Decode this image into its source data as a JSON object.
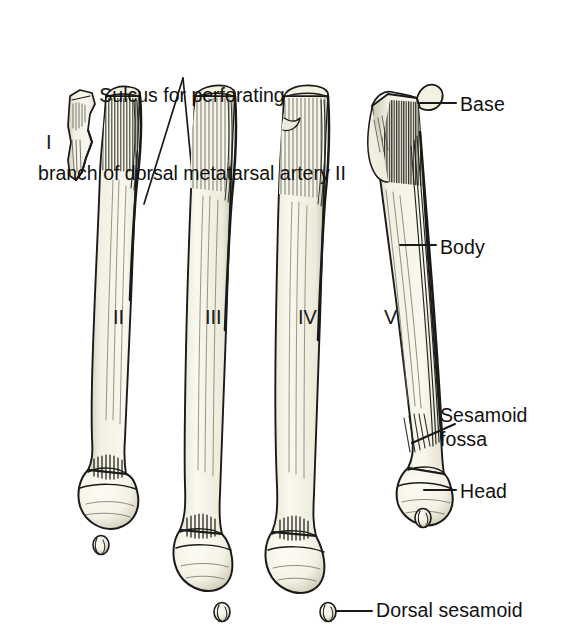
{
  "figure": {
    "kind": "anatomical-illustration",
    "background_color": "#ffffff",
    "ink_color": "#1a1a1a",
    "bone_fill_color": "#f7f5e8",
    "bone_shadow_color": "#d9d6c2"
  },
  "title": {
    "line1": "Sulcus for perforating",
    "line2": "branch of dorsal metatarsal artery II"
  },
  "numerals": [
    {
      "text": "I",
      "x": 46,
      "y": 132
    },
    {
      "text": "II",
      "x": 113,
      "y": 307
    },
    {
      "text": "III",
      "x": 205,
      "y": 307
    },
    {
      "text": "IV",
      "x": 298,
      "y": 307
    },
    {
      "text": "V",
      "x": 384,
      "y": 307
    }
  ],
  "labels": [
    {
      "id": "base",
      "text": "Base",
      "x": 460,
      "y": 93
    },
    {
      "id": "body",
      "text": "Body",
      "x": 440,
      "y": 236
    },
    {
      "id": "sesamoid-fossa-1",
      "text": "Sesamoid",
      "x": 440,
      "y": 404
    },
    {
      "id": "sesamoid-fossa-2",
      "text": "fossa",
      "x": 440,
      "y": 428
    },
    {
      "id": "head",
      "text": "Head",
      "x": 460,
      "y": 480
    },
    {
      "id": "dorsal-sesamoid",
      "text": "Dorsal sesamoid",
      "x": 356,
      "y": 599
    }
  ],
  "bones": [
    {
      "id": "metatarsal-1",
      "numeral": "I",
      "note": "proximal fragment only"
    },
    {
      "id": "metatarsal-2",
      "numeral": "II",
      "note": "full bone with head and sesamoid"
    },
    {
      "id": "metatarsal-3",
      "numeral": "III",
      "note": "full bone with head and sesamoid"
    },
    {
      "id": "metatarsal-4",
      "numeral": "IV",
      "note": "full bone with head and labelled dorsal sesamoid"
    },
    {
      "id": "metatarsal-5",
      "numeral": "V",
      "note": "full bone with tuberosity, sesamoid fossa, head and sesamoid"
    }
  ],
  "sesamoids": [
    {
      "id": "sesamoid-2",
      "x": 101,
      "y": 545
    },
    {
      "id": "sesamoid-3",
      "x": 222,
      "y": 612
    },
    {
      "id": "sesamoid-4",
      "x": 328,
      "y": 612
    },
    {
      "id": "sesamoid-5",
      "x": 423,
      "y": 518
    }
  ]
}
